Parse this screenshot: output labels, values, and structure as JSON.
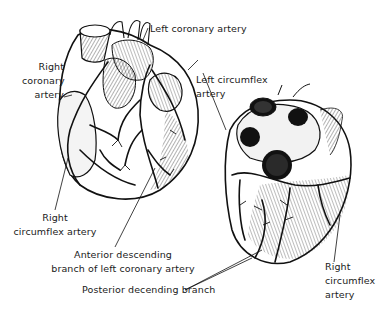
{
  "figure": {
    "views": [
      {
        "name": "anterior-view",
        "description": "Front view of the heart"
      },
      {
        "name": "posterior-view",
        "description": "Posterior/inferior view of the heart"
      }
    ],
    "colors": {
      "ink": "#111111",
      "background": "#ffffff"
    }
  },
  "labels": {
    "left_coronary_artery": "Left coronary artery",
    "right_coronary_artery": [
      "Right",
      "coronary",
      "artery"
    ],
    "left_circumflex_artery": [
      "Left circumflex",
      "artery"
    ],
    "right_circumflex_artery_left": [
      "Right",
      "circumflex artery"
    ],
    "anterior_descending": [
      "Anterior descending",
      "branch of left coronary artery"
    ],
    "posterior_descending": "Posterior decending branch",
    "right_circumflex_artery_right": [
      "Right",
      "circumflex",
      "artery"
    ]
  }
}
